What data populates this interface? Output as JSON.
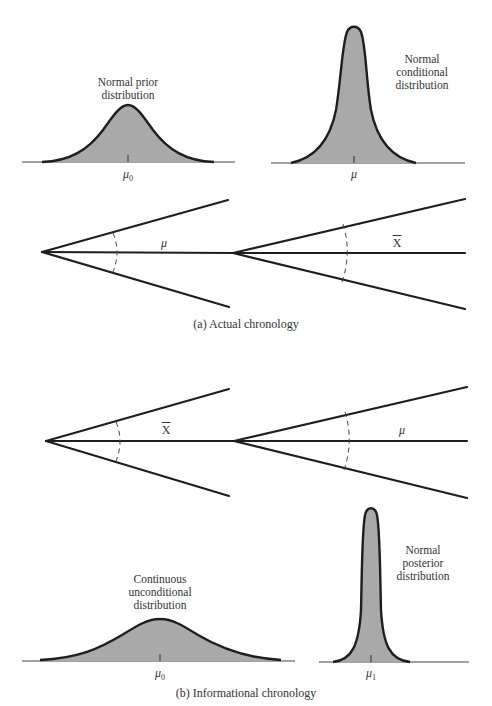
{
  "panel_a": {
    "caption": "(a) Actual chronology",
    "prior_curve": {
      "label_line1": "Normal prior",
      "label_line2": "distribution",
      "mean_symbol": "μ",
      "mean_subscript": "0"
    },
    "conditional_curve": {
      "label_line1": "Normal",
      "label_line2": "conditional",
      "label_line3": "distribution",
      "mean_symbol": "μ"
    },
    "tree": {
      "first_node_label": "μ",
      "second_node_label": "X"
    }
  },
  "panel_b": {
    "caption": "(b) Informational chronology",
    "tree": {
      "first_node_label": "X",
      "second_node_label": "μ"
    },
    "unconditional_curve": {
      "label_line1": "Continuous",
      "label_line2": "unconditional",
      "label_line3": "distribution",
      "mean_symbol": "μ",
      "mean_subscript": "0"
    },
    "posterior_curve": {
      "label_line1": "Normal",
      "label_line2": "posterior",
      "label_line3": "distribution",
      "mean_symbol": "μ",
      "mean_subscript": "1"
    }
  },
  "colors": {
    "fill": "#a9a9a9",
    "stroke": "#1e1e1e",
    "text": "#333333"
  }
}
